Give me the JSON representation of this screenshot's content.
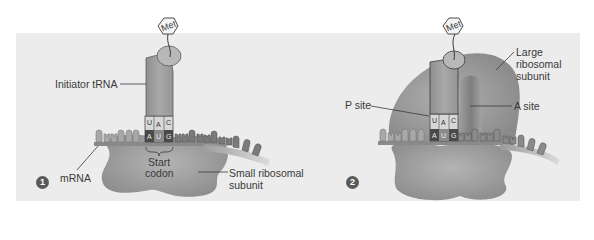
{
  "figure": {
    "background_color": "#ececec",
    "panels": [
      {
        "step": "1",
        "labels": {
          "trna": "Initiator tRNA",
          "amino_acid": "Met",
          "mrna": "mRNA",
          "start_codon_line1": "Start",
          "start_codon_line2": "codon",
          "small_subunit_line1": "Small ribosomal",
          "small_subunit_line2": "subunit"
        },
        "anticodon": [
          "U",
          "A",
          "C"
        ],
        "codon": [
          "A",
          "U",
          "G"
        ]
      },
      {
        "step": "2",
        "labels": {
          "amino_acid": "Met",
          "large_subunit_line1": "Large",
          "large_subunit_line2": "ribosomal",
          "large_subunit_line3": "subunit",
          "p_site": "P site",
          "a_site": "A site"
        },
        "anticodon": [
          "U",
          "A",
          "C"
        ],
        "codon": [
          "A",
          "U",
          "G"
        ]
      }
    ]
  }
}
